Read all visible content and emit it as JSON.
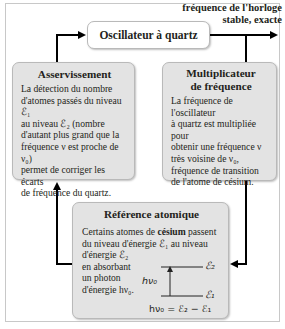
{
  "output": {
    "label_line1": "fréquence de l'horloge",
    "label_line2": "stable, exacte"
  },
  "oscillator": {
    "title": "Oscillateur à quartz"
  },
  "asservissement": {
    "title": "Asservissement",
    "text_lines": [
      "La détection du nombre",
      "d'atomes passés du niveau ℰ₁",
      "au niveau ℰ₂ (nombre",
      "d'autant plus grand que la",
      "fréquence ν est proche de ν₀)",
      "permet de corriger les écarts",
      "de fréquence du quartz."
    ]
  },
  "multiplicateur": {
    "title_line1": "Multiplicateur",
    "title_line2": "de fréquence",
    "text_lines": [
      "La fréquence de l'oscillateur",
      "à quartz est multipliée pour",
      "obtenir une fréquence ν",
      "très voisine de ν₀,",
      "fréquence de transition",
      "de l'atome de césium."
    ]
  },
  "reference": {
    "title": "Référence atomique",
    "line1_pre": "Certains atomes de ",
    "line1_bold": "césium",
    "line1_post": " passent",
    "line2": "du niveau d'énergie ℰ₁ au niveau",
    "left_lines": [
      "d'énergie ℰ₂",
      "en absorbant",
      "un photon",
      "d'énergie hν₀."
    ],
    "diagram": {
      "upper_level": "ℰ₂",
      "lower_level": "ℰ₁",
      "arrow_label": "hν₀",
      "equation": "hν₀ = ℰ₂ − ℰ₁"
    }
  },
  "colors": {
    "box_fill": "#e3e3e3",
    "box_border": "#b9b9b9",
    "arrow": "#000000",
    "text": "#231f20"
  }
}
